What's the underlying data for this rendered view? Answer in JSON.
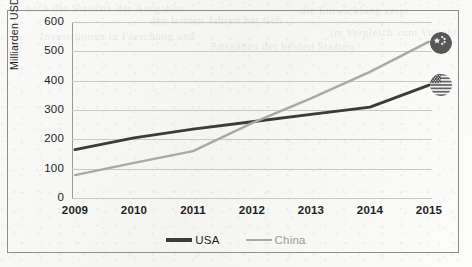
{
  "axis": {
    "y_title": "Milliarden USD",
    "y_ticks": [
      "600",
      "500",
      "400",
      "300",
      "200",
      "100",
      "0"
    ],
    "x_ticks": [
      "2009",
      "2010",
      "2011",
      "2012",
      "2013",
      "2014",
      "2015"
    ]
  },
  "legend": {
    "entries": [
      {
        "label": "USA",
        "color": "#3b3b3b"
      },
      {
        "label": "China",
        "color": "#a8a8a8"
      }
    ]
  },
  "icons": {
    "china_flag": "china-flag-badge-icon",
    "usa_flag": "usa-flag-badge-icon"
  },
  "bleed_text": [
    "nach der Statistik der Ausgaben",
    "den letzten Jahren hat sich",
    "die Entwicklung zeigt",
    "Investitionen in Forschung und",
    "Ausgaben der beiden Staaten",
    "im Vergleich zum Vorjahr"
  ],
  "chart_data": {
    "type": "line",
    "title": "",
    "xlabel": "",
    "ylabel": "Milliarden USD",
    "categories": [
      "2009",
      "2010",
      "2011",
      "2012",
      "2013",
      "2014",
      "2015"
    ],
    "ylim": [
      0,
      600
    ],
    "xlim": [
      "2009",
      "2015"
    ],
    "ytick_step": 100,
    "grid": "horizontal",
    "legend_position": "bottom-center",
    "series": [
      {
        "name": "USA",
        "color": "#3b3b3b",
        "values": [
          165,
          205,
          235,
          260,
          285,
          310,
          385
        ],
        "end_marker": "usa-flag-badge-icon"
      },
      {
        "name": "China",
        "color": "#a8a8a8",
        "values": [
          78,
          120,
          160,
          255,
          340,
          430,
          533
        ],
        "end_marker": "china-flag-badge-icon"
      }
    ]
  }
}
